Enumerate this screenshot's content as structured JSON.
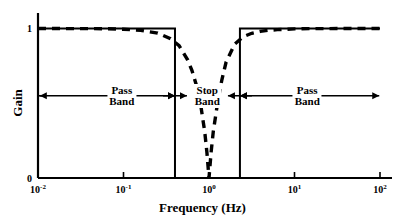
{
  "chart_data": {
    "type": "line",
    "title": "",
    "xlabel": "Frequency (Hz)",
    "ylabel": "Gain",
    "xscale": "log",
    "xlim": [
      0.01,
      100
    ],
    "ylim": [
      0,
      1.05
    ],
    "grid": false,
    "legend_position": "none",
    "xticks": [
      {
        "value": 0.01,
        "label_base": "10",
        "label_exp": "-2"
      },
      {
        "value": 0.1,
        "label_base": "10",
        "label_exp": "-1"
      },
      {
        "value": 1,
        "label_base": "10",
        "label_exp": "0"
      },
      {
        "value": 10,
        "label_base": "10",
        "label_exp": "1"
      },
      {
        "value": 100,
        "label_base": "10",
        "label_exp": "2"
      }
    ],
    "yticks": [
      {
        "value": 0,
        "label": "0"
      },
      {
        "value": 0.55,
        "label": ""
      },
      {
        "value": 1,
        "label": "1"
      }
    ],
    "series": [
      {
        "name": "Ideal band-stop response",
        "style": "solid",
        "color": "#000000",
        "x": [
          0.01,
          0.4,
          0.4,
          2.3,
          2.3,
          100
        ],
        "y": [
          1,
          1,
          0,
          0,
          1,
          1
        ]
      },
      {
        "name": "Actual band-stop response",
        "style": "dashed",
        "color": "#000000",
        "x": [
          0.01,
          0.0158,
          0.0251,
          0.0398,
          0.0631,
          0.1,
          0.1585,
          0.2512,
          0.3548,
          0.4467,
          0.5623,
          0.631,
          0.7079,
          0.7943,
          0.891,
          0.9441,
          1.0,
          1.0593,
          1.122,
          1.2589,
          1.4125,
          1.5849,
          1.9953,
          2.5119,
          3.1623,
          3.9811,
          5.0119,
          6.3096,
          10.0,
          15.849,
          25.119,
          39.811,
          63.096,
          100.0
        ],
        "y": [
          1.0,
          1.0,
          0.999,
          0.999,
          0.998,
          0.995,
          0.988,
          0.969,
          0.932,
          0.885,
          0.79,
          0.72,
          0.625,
          0.5,
          0.31,
          0.175,
          0.0,
          0.175,
          0.31,
          0.5,
          0.655,
          0.775,
          0.895,
          0.945,
          0.968,
          0.981,
          0.988,
          0.992,
          0.997,
          0.999,
          0.999,
          1.0,
          1.0,
          1.0
        ]
      }
    ],
    "annotations": [
      {
        "id": "pass-band-left",
        "lines": [
          "Pass",
          "Band"
        ],
        "label_x": 0.0955,
        "label_y": 0.55,
        "arrow": {
          "from_x": 0.0105,
          "to_x": 0.4,
          "y": 0.55,
          "heads": "both"
        }
      },
      {
        "id": "stop-band",
        "lines": [
          "Stop",
          "Band"
        ],
        "label_x": 0.955,
        "label_y": 0.55,
        "arrow": {
          "from_x": 0.4,
          "to_x": 2.3,
          "y": 0.55,
          "heads": "inward"
        }
      },
      {
        "id": "pass-band-right",
        "lines": [
          "Pass",
          "Band"
        ],
        "label_x": 14.1,
        "label_y": 0.55,
        "arrow": {
          "from_x": 2.3,
          "to_x": 98.0,
          "y": 0.55,
          "heads": "both"
        }
      }
    ]
  }
}
